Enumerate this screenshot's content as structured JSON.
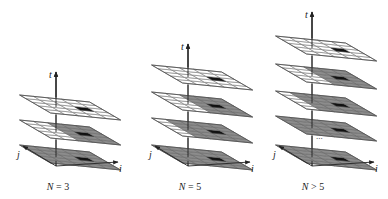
{
  "figure": {
    "axis_labels": {
      "time": "t",
      "row": "j",
      "col": "i"
    },
    "ellipsis": "...",
    "colors": {
      "empty_cell": "#ffffff",
      "filled_cell": "#8c8c8c",
      "target_cell": "#111111",
      "grid_line": "#555555",
      "axis": "#222222"
    },
    "grid_size": 5,
    "panels": [
      {
        "caption": "N = 3",
        "layers": [
          {
            "level": 0,
            "white_cols": 0,
            "white_rows_front": 0
          },
          {
            "level": 1,
            "white_cols": 2,
            "white_rows_front": 0
          },
          {
            "level": 2,
            "white_cols": 5,
            "white_rows_front": 0
          }
        ],
        "ellipsis": false
      },
      {
        "caption": "N = 5",
        "layers": [
          {
            "level": 0,
            "white_cols": 0,
            "white_rows_front": 0
          },
          {
            "level": 1,
            "white_cols": 1,
            "white_rows_front": 0
          },
          {
            "level": 2,
            "white_cols": 2,
            "white_rows_front": 0
          },
          {
            "level": 3,
            "white_cols": 5,
            "white_rows_front": 0
          }
        ],
        "ellipsis": false
      },
      {
        "caption": "N > 5",
        "layers": [
          {
            "level": 0,
            "white_cols": 0,
            "white_rows_front": 0
          },
          {
            "level": 1,
            "white_cols": 0,
            "white_rows_front": 0
          },
          {
            "level": 2,
            "white_cols": 1,
            "white_rows_front": 0
          },
          {
            "level": 3,
            "white_cols": 2,
            "white_rows_front": 0
          },
          {
            "level": 4,
            "white_cols": 5,
            "white_rows_front": 0
          }
        ],
        "ellipsis": true
      }
    ]
  }
}
